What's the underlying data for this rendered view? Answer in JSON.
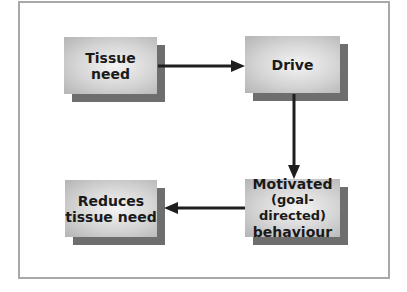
{
  "diagram": {
    "type": "flowchart",
    "nodes": [
      {
        "id": "tissue-need",
        "lines": [
          "Tissue",
          "need"
        ]
      },
      {
        "id": "drive",
        "lines": [
          "Drive"
        ]
      },
      {
        "id": "motivated-behaviour",
        "lines": [
          "Motivated",
          "(goal-directed)",
          "behaviour"
        ]
      },
      {
        "id": "reduces-tissue-need",
        "lines": [
          "Reduces",
          "tissue need"
        ]
      }
    ],
    "edges": [
      {
        "from": "tissue-need",
        "to": "drive",
        "direction": "right"
      },
      {
        "from": "drive",
        "to": "motivated-behaviour",
        "direction": "down"
      },
      {
        "from": "motivated-behaviour",
        "to": "reduces-tissue-need",
        "direction": "left"
      }
    ],
    "colors": {
      "frame": "#a8a8a8",
      "shadow": "#6e6e6e",
      "box_light": "#f4f4f4",
      "box_dark": "#b4b4b4",
      "arrow": "#1e1e1e",
      "text": "#1a1a1a"
    }
  }
}
